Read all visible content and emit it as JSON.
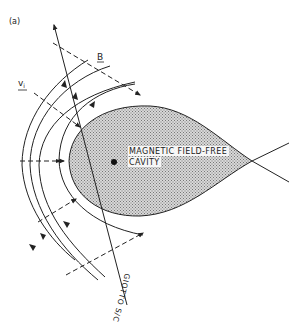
{
  "figure": {
    "panel_label": "(a)",
    "labels": {
      "magnetic_field": "B",
      "ion_velocity": "v",
      "ion_velocity_subscript": "i",
      "cavity_line1": "MAGNETIC FIELD-FREE",
      "cavity_line2": "CAVITY",
      "spacecraft": "GIOTTO S/C"
    },
    "elements": {
      "cavity": "teardrop-shaped stippled region",
      "field_lines": "four concentric curved magnetic field lines draping around cavity with arrows",
      "trajectory": "Giotto spacecraft trajectory line with arrow",
      "dashed_vectors": "dashed arrows indicating B direction and ion velocity",
      "nucleus": "black dot inside cavity"
    },
    "colors": {
      "line": "#222222",
      "cavity_fill": "#bdbdbd",
      "background": "#ffffff"
    }
  }
}
